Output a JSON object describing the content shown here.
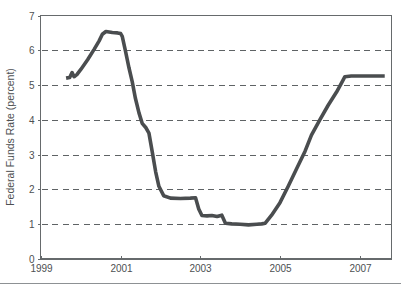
{
  "figure": {
    "background_color": "#ffffff",
    "footer_rule_color": "#8d9194",
    "footer_rule_y": 283
  },
  "chart_data": {
    "type": "line",
    "title": "",
    "subtitle": "",
    "xlabel": "",
    "ylabel": "Federal Funds Rate (percent)",
    "xlim": [
      1999.0,
      2007.8
    ],
    "ylim": [
      0,
      7
    ],
    "x_ticks": [
      1999,
      2001,
      2003,
      2005,
      2007
    ],
    "x_tick_labels": [
      "1999",
      "2001",
      "2003",
      "2005",
      "2007"
    ],
    "y_ticks": [
      0,
      1,
      2,
      3,
      4,
      5,
      6,
      7
    ],
    "y_tick_labels": [
      "0",
      "1",
      "2",
      "3",
      "4",
      "5",
      "6",
      "7"
    ],
    "grid": true,
    "grid_axis": "y",
    "grid_values": [
      1,
      2,
      3,
      4,
      5,
      6
    ],
    "grid_style": "dashed",
    "grid_color": "#5f6365",
    "legend": null,
    "legend_position": "none",
    "line_color": "#4a4d4f",
    "line_width": 3.6,
    "series": [
      {
        "name": "Federal Funds Rate",
        "x": [
          1999.63,
          1999.72,
          1999.78,
          1999.83,
          1999.9,
          2000.0,
          2000.17,
          2000.33,
          2000.46,
          2000.54,
          2000.63,
          2000.79,
          2000.92,
          2001.0,
          2001.04,
          2001.12,
          2001.21,
          2001.29,
          2001.37,
          2001.46,
          2001.54,
          2001.63,
          2001.71,
          2001.79,
          2001.88,
          2001.96,
          2002.08,
          2002.25,
          2002.5,
          2002.75,
          2002.88,
          2002.96,
          2003.04,
          2003.17,
          2003.29,
          2003.42,
          2003.54,
          2003.63,
          2003.79,
          2004.0,
          2004.21,
          2004.42,
          2004.54,
          2004.63,
          2004.79,
          2005.0,
          2005.21,
          2005.42,
          2005.63,
          2005.79,
          2006.0,
          2006.21,
          2006.42,
          2006.54,
          2006.63,
          2006.79,
          2007.0,
          2007.21,
          2007.42,
          2007.63
        ],
        "y": [
          5.2,
          5.22,
          5.36,
          5.24,
          5.3,
          5.45,
          5.73,
          6.02,
          6.27,
          6.46,
          6.54,
          6.51,
          6.5,
          6.48,
          6.4,
          5.98,
          5.49,
          5.1,
          4.62,
          4.2,
          3.9,
          3.78,
          3.62,
          3.1,
          2.5,
          2.09,
          1.82,
          1.75,
          1.74,
          1.75,
          1.76,
          1.44,
          1.25,
          1.24,
          1.25,
          1.22,
          1.26,
          1.03,
          1.01,
          1.0,
          0.98,
          1.0,
          1.01,
          1.03,
          1.26,
          1.62,
          2.1,
          2.6,
          3.1,
          3.56,
          4.0,
          4.42,
          4.8,
          5.05,
          5.24,
          5.26,
          5.26,
          5.26,
          5.26,
          5.26
        ]
      }
    ]
  },
  "axes": {
    "left_spine": true,
    "bottom_spine": true,
    "top_spine": true,
    "right_spine": true,
    "spine_color": "#666a6c"
  }
}
